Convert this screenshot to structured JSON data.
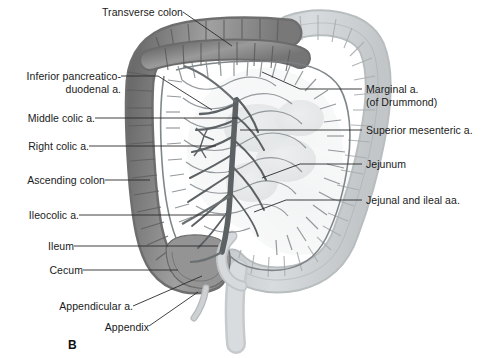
{
  "figure": {
    "panel_letter": "B",
    "background_color": "#ffffff",
    "colon_dark_color": "#8e8e8e",
    "colon_light_color": "#c9cdcf",
    "vessel_color": "#6f7477",
    "leader_color": "#2b2b2b",
    "text_color": "#1a1a1a"
  },
  "labels_left": [
    {
      "id": "inferior-pancreaticoduodenal-a",
      "text": "Inferior pancreatico-\nduodenal a.",
      "x": 10,
      "y": 70
    },
    {
      "id": "middle-colic-a",
      "text": "Middle colic a.",
      "x": 10,
      "y": 112
    },
    {
      "id": "right-colic-a",
      "text": "Right colic a.",
      "x": 10,
      "y": 140
    },
    {
      "id": "ascending-colon",
      "text": "Ascending colon",
      "x": 10,
      "y": 174
    },
    {
      "id": "ileocolic-a",
      "text": "Ileocolic a.",
      "x": 10,
      "y": 209
    },
    {
      "id": "ileum",
      "text": "Ileum",
      "x": 10,
      "y": 240
    },
    {
      "id": "cecum",
      "text": "Cecum",
      "x": 10,
      "y": 264
    },
    {
      "id": "appendicular-a",
      "text": "Appendicular a.",
      "x": 10,
      "y": 306
    },
    {
      "id": "appendix",
      "text": "Appendix",
      "x": 10,
      "y": 327
    }
  ],
  "labels_right": [
    {
      "id": "marginal-a",
      "text": "Marginal a.\n(of Drummond)",
      "x": 366,
      "y": 83
    },
    {
      "id": "superior-mesenteric-a",
      "text": "Superior mesenteric a.",
      "x": 366,
      "y": 124
    },
    {
      "id": "jejunum",
      "text": "Jejunum",
      "x": 366,
      "y": 158
    },
    {
      "id": "jejunal-and-ileal-aa",
      "text": "Jejunal and ileal aa.",
      "x": 366,
      "y": 194
    }
  ],
  "labels_top": [
    {
      "id": "transverse-colon",
      "text": "Transverse colon",
      "x": 97,
      "y": 6
    }
  ],
  "structures": [
    {
      "id": "transverse-colon-structure",
      "name": "Transverse colon"
    },
    {
      "id": "ascending-colon-structure",
      "name": "Ascending colon"
    },
    {
      "id": "descending-colon-structure",
      "name": "Descending colon"
    },
    {
      "id": "sigmoid-colon-structure",
      "name": "Sigmoid colon"
    },
    {
      "id": "cecum-structure",
      "name": "Cecum"
    },
    {
      "id": "appendix-structure",
      "name": "Appendix"
    },
    {
      "id": "ileum-structure",
      "name": "Ileum"
    },
    {
      "id": "jejunum-structure",
      "name": "Jejunum"
    },
    {
      "id": "superior-mesenteric-artery-structure",
      "name": "Superior mesenteric artery"
    },
    {
      "id": "marginal-artery-structure",
      "name": "Marginal artery of Drummond"
    },
    {
      "id": "mesenteric-arcade-structure",
      "name": "Mesenteric arcades"
    }
  ]
}
